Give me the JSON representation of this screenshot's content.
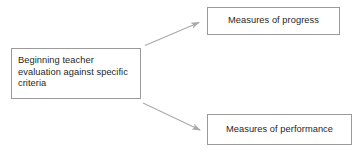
{
  "diagram": {
    "type": "flowchart",
    "background_color": "#ffffff",
    "box_border_color": "#9a9a9a",
    "arrow_color": "#a9a9a9",
    "text_color": "#1f1f1f",
    "nodes": {
      "source": {
        "label": "Beginning teacher\nevaluation against specific\ncriteria"
      },
      "progress": {
        "label": "Measures of progress"
      },
      "performance": {
        "label": "Measures of performance"
      }
    },
    "arrows": [
      {
        "name": "source-to-progress",
        "from": "source",
        "to": "progress",
        "direction": "up-right"
      },
      {
        "name": "source-to-performance",
        "from": "source",
        "to": "performance",
        "direction": "down-right"
      }
    ]
  }
}
